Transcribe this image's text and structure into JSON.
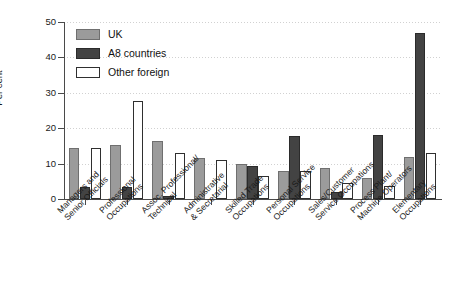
{
  "chart_data": {
    "type": "bar",
    "title": "",
    "xlabel": "",
    "ylabel": "Per cent",
    "ylim": [
      0,
      50
    ],
    "yticks": [
      0,
      10,
      20,
      30,
      40,
      50
    ],
    "grid": true,
    "legend_position": "top-left",
    "categories": [
      "Managers and Senior Officials",
      "Professional Occupations",
      "Assoc. Professional/ Technical",
      "Administrative & Secretarial",
      "Skilled Trade Occupations",
      "Personal Service Occupations",
      "Sales/Customer Service Occupations",
      "Process Plant/ Machine Operators",
      "Elementary Occupations"
    ],
    "category_lines": [
      [
        "Managers and",
        "Senior Officials"
      ],
      [
        "Professional",
        "Occupations"
      ],
      [
        "Assoc. Professional/",
        "Technical"
      ],
      [
        "Administrative",
        "& Secretarial"
      ],
      [
        "Skilled Trade",
        "Occupations"
      ],
      [
        "Personal Service",
        "Occupations"
      ],
      [
        "Sales/Customer",
        "Service Occupations"
      ],
      [
        "Process Plant/",
        "Machine Operators"
      ],
      [
        "Elementary",
        "Occupations"
      ]
    ],
    "series": [
      {
        "name": "UK",
        "color": "#9b9b9b",
        "values": [
          14.5,
          15.3,
          16.5,
          11.5,
          10.0,
          8.0,
          8.8,
          6.0,
          12.0
        ]
      },
      {
        "name": "A8 countries",
        "color": "#434343",
        "values": [
          3.3,
          3.3,
          0.8,
          0.0,
          9.3,
          17.7,
          2.0,
          18.0,
          47.0
        ]
      },
      {
        "name": "Other foreign",
        "color": "#ffffff",
        "values": [
          14.5,
          27.7,
          13.0,
          11.0,
          6.5,
          8.0,
          4.5,
          3.7,
          13.0
        ]
      }
    ]
  },
  "legend": {
    "items": [
      {
        "label": "UK"
      },
      {
        "label": "A8 countries"
      },
      {
        "label": "Other foreign"
      }
    ]
  },
  "axis": {
    "y_title": "Per cent",
    "y_tick_labels": [
      "0",
      "10",
      "20",
      "30",
      "40",
      "50"
    ]
  }
}
